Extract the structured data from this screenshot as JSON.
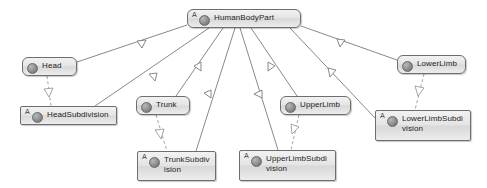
{
  "diagram": {
    "type": "uml-class-diagram",
    "background_color": "#ffffff",
    "node_fill_color": "#e4e4e4",
    "node_border_color": "#6e6e6e",
    "edge_color": "#7a7a7a",
    "abstract_marker": "A"
  },
  "nodes": [
    {
      "id": "humanbodypart",
      "label": "HumanBodyPart",
      "abstract": true,
      "icon": "class-circle-icon",
      "x": 187,
      "y": 9,
      "w": 114,
      "h": 19
    },
    {
      "id": "head",
      "label": "Head",
      "abstract": false,
      "icon": "class-circle-icon",
      "x": 22,
      "y": 57,
      "w": 55,
      "h": 19
    },
    {
      "id": "headsubdivision",
      "label": "HeadSubdivision",
      "abstract": true,
      "icon": "class-circle-icon",
      "x": 20,
      "y": 106,
      "w": 97,
      "h": 19
    },
    {
      "id": "trunk",
      "label": "Trunk",
      "abstract": false,
      "icon": "class-circle-icon",
      "x": 136,
      "y": 96,
      "w": 54,
      "h": 19
    },
    {
      "id": "trunksubdivision",
      "label": "TrunkSubdivision",
      "abstract": true,
      "icon": "class-circle-icon",
      "x": 137,
      "y": 151,
      "w": 79,
      "h": 30
    },
    {
      "id": "upperlimb",
      "label": "UpperLimb",
      "abstract": false,
      "icon": "class-circle-icon",
      "x": 280,
      "y": 96,
      "w": 71,
      "h": 19
    },
    {
      "id": "upperlimbsubdivision",
      "label": "UpperLimbSubdivision",
      "abstract": true,
      "icon": "class-circle-icon",
      "x": 239,
      "y": 150,
      "w": 97,
      "h": 31
    },
    {
      "id": "lowerlimb",
      "label": "LowerLimb",
      "abstract": false,
      "icon": "class-circle-icon",
      "x": 397,
      "y": 55,
      "w": 69,
      "h": 19
    },
    {
      "id": "lowerlimbsubdivision",
      "label": "LowerLimbSubdivision",
      "abstract": true,
      "icon": "class-circle-icon",
      "x": 375,
      "y": 110,
      "w": 96,
      "h": 31
    }
  ],
  "edges": [
    {
      "from": "head",
      "to": "humanbodypart",
      "kind": "generalization"
    },
    {
      "from": "headsubdivision",
      "to": "humanbodypart",
      "kind": "generalization"
    },
    {
      "from": "trunk",
      "to": "humanbodypart",
      "kind": "generalization"
    },
    {
      "from": "trunksubdivision",
      "to": "humanbodypart",
      "kind": "generalization"
    },
    {
      "from": "upperlimb",
      "to": "humanbodypart",
      "kind": "generalization"
    },
    {
      "from": "upperlimbsubdivision",
      "to": "humanbodypart",
      "kind": "generalization"
    },
    {
      "from": "lowerlimb",
      "to": "humanbodypart",
      "kind": "generalization"
    },
    {
      "from": "lowerlimbsubdivision",
      "to": "humanbodypart",
      "kind": "generalization"
    },
    {
      "from": "head",
      "to": "headsubdivision",
      "kind": "dependency"
    },
    {
      "from": "trunk",
      "to": "trunksubdivision",
      "kind": "dependency"
    },
    {
      "from": "upperlimb",
      "to": "upperlimbsubdivision",
      "kind": "dependency"
    },
    {
      "from": "lowerlimb",
      "to": "lowerlimbsubdivision",
      "kind": "dependency"
    }
  ]
}
